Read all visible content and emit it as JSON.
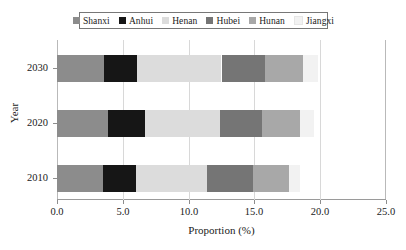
{
  "chart_data": {
    "type": "bar",
    "orientation": "horizontal",
    "stacked": true,
    "title": "",
    "xlabel": "Proportion (%)",
    "ylabel": "Year",
    "categories": [
      "2010",
      "2020",
      "2030"
    ],
    "category_order_top_to_bottom": [
      "2030",
      "2020",
      "2010"
    ],
    "xlim": [
      0.0,
      25.0
    ],
    "xticks": [
      0.0,
      5.0,
      10.0,
      15.0,
      20.0,
      25.0
    ],
    "xtick_labels": [
      "0.0",
      "5.0",
      "10.0",
      "15.0",
      "20.0",
      "25.0"
    ],
    "ytick_labels": [
      "2030",
      "2020",
      "2010"
    ],
    "grid": "vertical",
    "legend_position": "top-center",
    "series": [
      {
        "name": "Shanxi",
        "color": "#8c8c8c",
        "values": [
          3.5,
          3.9,
          3.6
        ]
      },
      {
        "name": "Anhui",
        "color": "#161616",
        "values": [
          2.5,
          2.8,
          2.5
        ]
      },
      {
        "name": "Henan",
        "color": "#dcdcdc",
        "values": [
          5.4,
          5.7,
          6.4
        ]
      },
      {
        "name": "Hubei",
        "color": "#757575",
        "values": [
          3.5,
          3.2,
          3.3
        ]
      },
      {
        "name": "Hunan",
        "color": "#a8a8a8",
        "values": [
          2.7,
          2.9,
          2.9
        ]
      },
      {
        "name": "Jiangxi",
        "color": "#f2f2f2",
        "values": [
          0.9,
          1.0,
          1.1
        ]
      }
    ],
    "totals": [
      18.5,
      19.5,
      19.8
    ]
  },
  "legend": {
    "entries": [
      {
        "label": "Shanxi"
      },
      {
        "label": "Anhui"
      },
      {
        "label": "Henan"
      },
      {
        "label": "Hubei"
      },
      {
        "label": "Hunan"
      },
      {
        "label": "Jiangxi"
      }
    ]
  },
  "axes": {
    "x_title": "Proportion (%)",
    "y_title": "Year"
  }
}
